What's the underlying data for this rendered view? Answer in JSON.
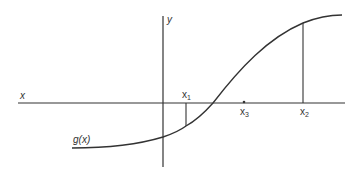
{
  "diagram": {
    "axes": {
      "x_label": "x",
      "y_label": "y"
    },
    "curve": {
      "label": "g(x)"
    },
    "points": [
      {
        "id": "x1",
        "label": "x",
        "sub": "1"
      },
      {
        "id": "x3",
        "label": "x",
        "sub": "3"
      },
      {
        "id": "x2",
        "label": "x",
        "sub": "2"
      }
    ],
    "colors": {
      "line": "#333333",
      "background": "#ffffff"
    }
  }
}
